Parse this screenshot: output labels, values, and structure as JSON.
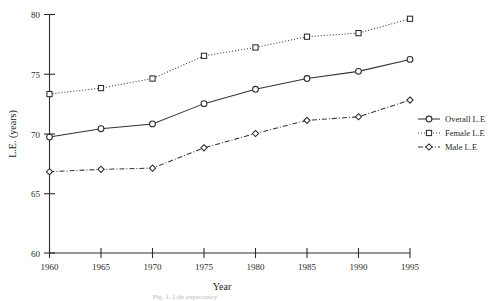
{
  "chart_data": {
    "type": "line",
    "title": "",
    "xlabel": "Year",
    "ylabel": "L.E. (years)",
    "x": [
      1960,
      1965,
      1970,
      1975,
      1980,
      1985,
      1990,
      1995
    ],
    "xlim": [
      1960,
      1995
    ],
    "ylim": [
      60,
      80
    ],
    "yticks": [
      60,
      65,
      70,
      75,
      80
    ],
    "xticks": [
      1960,
      1965,
      1970,
      1975,
      1980,
      1985,
      1990,
      1995
    ],
    "grid": false,
    "legend_position": "right",
    "series": [
      {
        "name": "Overall L.E",
        "marker": "circle",
        "linestyle": "solid",
        "values": [
          69.7,
          70.4,
          70.8,
          72.5,
          73.7,
          74.6,
          75.2,
          76.2
        ]
      },
      {
        "name": "Female L.E",
        "marker": "square",
        "linestyle": "dotted",
        "values": [
          73.3,
          73.8,
          74.6,
          76.5,
          77.2,
          78.1,
          78.4,
          79.6
        ]
      },
      {
        "name": "Male L.E",
        "marker": "diamond",
        "linestyle": "dashdot",
        "values": [
          66.8,
          67.0,
          67.1,
          68.8,
          70.0,
          71.1,
          71.4,
          72.8
        ]
      }
    ]
  },
  "axes": {
    "y_tick_labels": [
      "60",
      "65",
      "70",
      "75",
      "80"
    ],
    "x_tick_labels": [
      "1960",
      "1965",
      "1970",
      "1975",
      "1980",
      "1985",
      "1990",
      "1995"
    ],
    "y_title": "L.E. (years)",
    "x_title": "Year"
  },
  "legend": {
    "items": [
      {
        "label": "Overall L.E",
        "marker": "circle",
        "linestyle": "solid"
      },
      {
        "label": "Female L.E",
        "marker": "square",
        "linestyle": "dotted"
      },
      {
        "label": "Male L.E",
        "marker": "diamond",
        "linestyle": "dashdot"
      }
    ]
  },
  "caption": {
    "text": "Fig. 1. Life expectancy"
  },
  "colors": {
    "line": "#333333",
    "axis": "#2e2e2e",
    "text": "#2b2b2b",
    "background": "#ffffff"
  }
}
